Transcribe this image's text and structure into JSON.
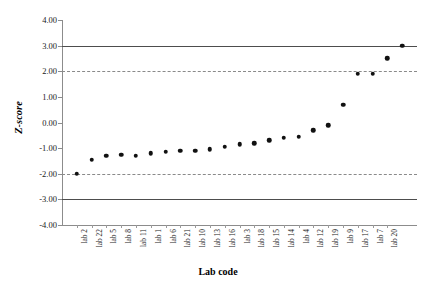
{
  "chart_data": {
    "type": "scatter",
    "title": "",
    "xlabel": "Lab code",
    "ylabel": "Z-score",
    "ylim": [
      -4,
      4
    ],
    "ytick_labels": [
      "4.00",
      "3.00",
      "2.00",
      "1.00",
      "0.00",
      "-1.00",
      "-2.00",
      "-3.00",
      "-4.00"
    ],
    "ytick_values": [
      4,
      3,
      2,
      1,
      0,
      -1,
      -2,
      -3,
      -4
    ],
    "grid": false,
    "legend": "none",
    "reference_lines": [
      {
        "value": 3,
        "style": "solid",
        "color": "#4d4d4d"
      },
      {
        "value": 2,
        "style": "dashed",
        "color": "#8a8a8a"
      },
      {
        "value": -2,
        "style": "dashed",
        "color": "#8a8a8a"
      },
      {
        "value": -3,
        "style": "solid",
        "color": "#4d4d4d"
      }
    ],
    "categories": [
      "lab 2",
      "lab 22",
      "lab 5",
      "lab 8",
      "lab 11",
      "lab 1",
      "lab 6",
      "lab 21",
      "lab 10",
      "lab 13",
      "lab 16",
      "lab 3",
      "lab 18",
      "lab 15",
      "lab 14",
      "lab 4",
      "lab 12",
      "lab 19",
      "lab 9",
      "lab 17",
      "lab 7",
      "lab 20"
    ],
    "values": [
      -2.0,
      -1.45,
      -1.3,
      -1.25,
      -1.3,
      -1.2,
      -1.15,
      -1.1,
      -1.1,
      -1.05,
      -0.95,
      -0.85,
      -0.8,
      -0.7,
      -0.6,
      -0.55,
      -0.3,
      -0.1,
      0.7,
      1.9,
      1.9,
      2.5
    ],
    "series": [
      {
        "name": "Z-score",
        "values": [
          -2.0,
          -1.45,
          -1.3,
          -1.25,
          -1.3,
          -1.2,
          -1.15,
          -1.1,
          -1.1,
          -1.05,
          -0.95,
          -0.85,
          -0.8,
          -0.7,
          -0.6,
          -0.55,
          -0.3,
          -0.1,
          0.7,
          1.9,
          1.9,
          2.5
        ]
      }
    ],
    "marker": {
      "shape": "circle",
      "color": "#111111",
      "size": 4.5
    }
  },
  "chart_points": [
    {
      "label": "lab 2",
      "value": -2.0
    },
    {
      "label": "lab 22",
      "value": -1.45
    },
    {
      "label": "lab 5",
      "value": -1.3
    },
    {
      "label": "lab 8",
      "value": -1.25
    },
    {
      "label": "lab 11",
      "value": -1.3
    },
    {
      "label": "lab 1",
      "value": -1.2
    },
    {
      "label": "lab 6",
      "value": -1.15
    },
    {
      "label": "lab 21",
      "value": -1.1
    },
    {
      "label": "lab 10",
      "value": -1.1
    },
    {
      "label": "lab 13",
      "value": -1.05
    },
    {
      "label": "lab 16",
      "value": -0.95
    },
    {
      "label": "lab 3",
      "value": -0.85
    },
    {
      "label": "lab 18",
      "value": -0.8
    },
    {
      "label": "lab 15",
      "value": -0.7
    },
    {
      "label": "lab 14",
      "value": -0.6
    },
    {
      "label": "lab 4",
      "value": -0.55
    },
    {
      "label": "lab 12",
      "value": -0.3
    },
    {
      "label": "lab 19",
      "value": -0.1
    },
    {
      "label": "lab 9",
      "value": 0.7
    },
    {
      "label": "lab 17",
      "value": 1.9
    },
    {
      "label": "lab 7",
      "value": 1.9
    },
    {
      "label": "lab 20",
      "value": 2.5
    },
    {
      "label": "lab 20b",
      "value": 3.0
    }
  ]
}
